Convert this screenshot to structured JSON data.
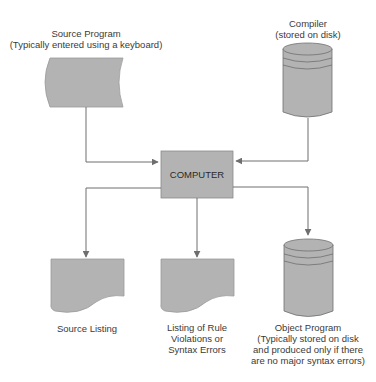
{
  "colors": {
    "shape_fill": "#b3b3b3",
    "stroke": "#6e6e6e",
    "text": "#3a3a3a",
    "background": "#ffffff"
  },
  "nodes": {
    "source_program": {
      "shape": "keyboard-input",
      "title": "Source Program",
      "subtitle": "(Typically entered using a keyboard)"
    },
    "compiler": {
      "shape": "disk-cylinder",
      "title": "Compiler",
      "subtitle": "(stored on disk)"
    },
    "computer": {
      "shape": "process-box",
      "title": "COMPUTER"
    },
    "source_listing": {
      "shape": "document",
      "title": "Source Listing"
    },
    "rule_violations": {
      "shape": "document",
      "line1": "Listing of Rule",
      "line2": "Violations or",
      "line3": "Syntax Errors"
    },
    "object_program": {
      "shape": "disk-cylinder",
      "line1": "Object Program",
      "line2": "(Typically stored on disk",
      "line3": "and produced only if there",
      "line4": "are no major syntax errors)"
    }
  },
  "edges": [
    {
      "from": "source_program",
      "to": "computer"
    },
    {
      "from": "compiler",
      "to": "computer"
    },
    {
      "from": "computer",
      "to": "source_listing"
    },
    {
      "from": "computer",
      "to": "rule_violations"
    },
    {
      "from": "computer",
      "to": "object_program"
    }
  ]
}
